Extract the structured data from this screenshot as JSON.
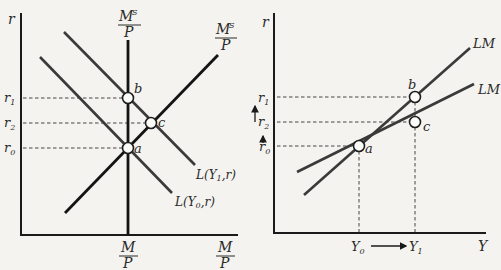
{
  "left_panel": {
    "y_axis_label": "r",
    "x_axis_label_num": "M",
    "x_axis_label_den": "P",
    "money_supply_label_num": "M",
    "money_supply_label_sup": "S",
    "money_supply_label_den": "P",
    "money_supply_label2_num": "M",
    "money_supply_label2_sup": "S",
    "money_supply_label2_den": "P",
    "x_tick_num": "M",
    "x_tick_den": "P",
    "y_ticks": [
      {
        "base": "r",
        "sub": "1"
      },
      {
        "base": "r",
        "sub": "2"
      },
      {
        "base": "r",
        "sub": "0"
      }
    ],
    "points": [
      "b",
      "c",
      "a"
    ],
    "curve_labels": {
      "L_Y1": {
        "prefix": "L(Y",
        "sub": "1",
        "suffix": ",r)"
      },
      "L_Y0": {
        "prefix": "L(Y",
        "sub": "0",
        "suffix": ",r)"
      }
    }
  },
  "right_panel": {
    "y_axis_label": "r",
    "x_axis_label": "Y",
    "y_ticks": [
      {
        "base": "r",
        "sub": "1"
      },
      {
        "base": "r",
        "sub": "2"
      },
      {
        "base": "r",
        "sub": "0"
      }
    ],
    "x_ticks": [
      {
        "base": "Y",
        "sub": "0"
      },
      {
        "base": "Y",
        "sub": "1"
      }
    ],
    "points": [
      "b",
      "c",
      "a"
    ],
    "curve_labels": [
      "LM",
      "LM"
    ]
  },
  "colors": {
    "background": "#f4f3ef",
    "lines": "#1a1a1a",
    "point_fill": "#fbfbf8"
  }
}
